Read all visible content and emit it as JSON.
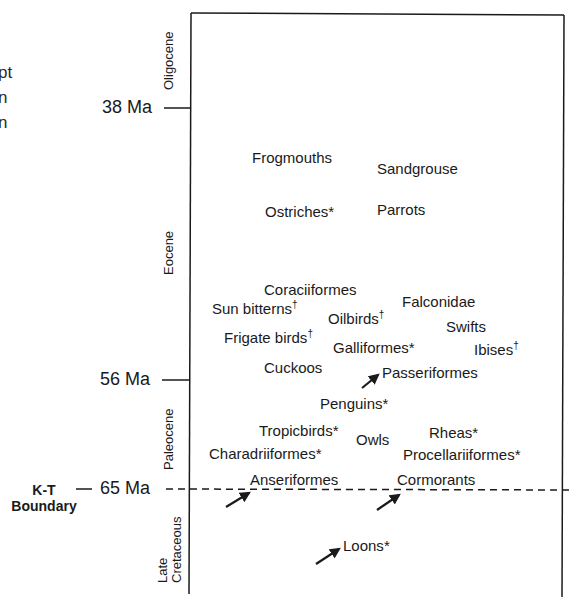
{
  "left_cut_text": [
    "pt",
    "n",
    "n"
  ],
  "time_markers": [
    {
      "label": "38 Ma",
      "y": 108
    },
    {
      "label": "56 Ma",
      "y": 381
    },
    {
      "label": "65 Ma",
      "y": 489
    }
  ],
  "kt_boundary": {
    "line1": "K-T",
    "line2": "Boundary"
  },
  "epochs": [
    {
      "name": "Oligocene"
    },
    {
      "name": "Eocene"
    },
    {
      "name": "Paleocene"
    },
    {
      "name_line1": "Late",
      "name_line2": "Cretaceous"
    }
  ],
  "taxa": [
    {
      "name": "Frogmouths",
      "mark": ""
    },
    {
      "name": "Sandgrouse",
      "mark": ""
    },
    {
      "name": "Ostriches",
      "mark": "*"
    },
    {
      "name": "Parrots",
      "mark": ""
    },
    {
      "name": "Coraciiformes",
      "mark": ""
    },
    {
      "name": "Sun bitterns",
      "mark": "†"
    },
    {
      "name": "Oilbirds",
      "mark": "†"
    },
    {
      "name": "Falconidae",
      "mark": ""
    },
    {
      "name": "Swifts",
      "mark": ""
    },
    {
      "name": "Frigate birds",
      "mark": "†"
    },
    {
      "name": "Galliformes",
      "mark": "*"
    },
    {
      "name": "Ibises",
      "mark": "†"
    },
    {
      "name": "Cuckoos",
      "mark": ""
    },
    {
      "name": "Passeriformes",
      "mark": ""
    },
    {
      "name": "Penguins",
      "mark": "*"
    },
    {
      "name": "Tropicbirds",
      "mark": "*"
    },
    {
      "name": "Owls",
      "mark": ""
    },
    {
      "name": "Rheas",
      "mark": "*"
    },
    {
      "name": "Charadriiformes",
      "mark": "*"
    },
    {
      "name": "Procellariiformes",
      "mark": "*"
    },
    {
      "name": "Anseriformes",
      "mark": ""
    },
    {
      "name": "Cormorants",
      "mark": ""
    },
    {
      "name": "Loons",
      "mark": "*"
    }
  ],
  "arrows_point_to": [
    "Passeriformes",
    "Anseriformes",
    "Cormorants",
    "Loons"
  ],
  "colors": {
    "ink": "#1a1a1a",
    "background": "#ffffff"
  }
}
